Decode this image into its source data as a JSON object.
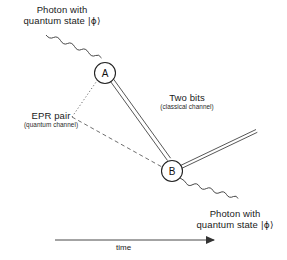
{
  "diagram": {
    "background_color": "#ffffff",
    "line_color": "#333333",
    "text_color": "#1a1a1a",
    "width": 287,
    "height": 260
  },
  "labels": {
    "photon_in": {
      "line1": "Photon with",
      "line2_prefix": "quantum state ",
      "ket": "|ϕ⟩"
    },
    "photon_out": {
      "line1": "Photon with",
      "line2_prefix": "quantum state ",
      "ket": "|ϕ⟩"
    },
    "two_bits": {
      "title": "Two bits",
      "subtitle": "(classical channel)"
    },
    "epr_pair": {
      "title": "EPR pair",
      "subtitle": "(quantum channel)"
    },
    "time_axis": {
      "label": "time"
    }
  },
  "nodes": [
    {
      "id": "A",
      "letter": "A",
      "cx": 105,
      "cy": 73,
      "r": 10.5
    },
    {
      "id": "B",
      "letter": "B",
      "cx": 172,
      "cy": 171,
      "r": 10.5
    }
  ],
  "channels": {
    "classical": {
      "name": "Two bits classical channel",
      "style": "double-line",
      "from": "A",
      "to": "B"
    },
    "quantum": {
      "name": "EPR pair quantum channel",
      "style": "dotted-and-dashed",
      "vertex_x": 72,
      "vertex_y": 117,
      "to_a": "dotted",
      "to_b": "dashed"
    },
    "photon_in": {
      "name": "incoming photon",
      "style": "wavy",
      "from_x": 46,
      "from_y": 35,
      "to": "A"
    },
    "photon_out": {
      "name": "outgoing photon",
      "style": "wavy",
      "from": "B",
      "to_x": 238,
      "to_y": 204
    },
    "beam_out": {
      "name": "outgoing double beam from B",
      "style": "double-line",
      "from": "B",
      "to_x": 256,
      "to_y": 131
    }
  },
  "time_axis": {
    "x_start": 55,
    "x_end": 219,
    "y": 240
  }
}
